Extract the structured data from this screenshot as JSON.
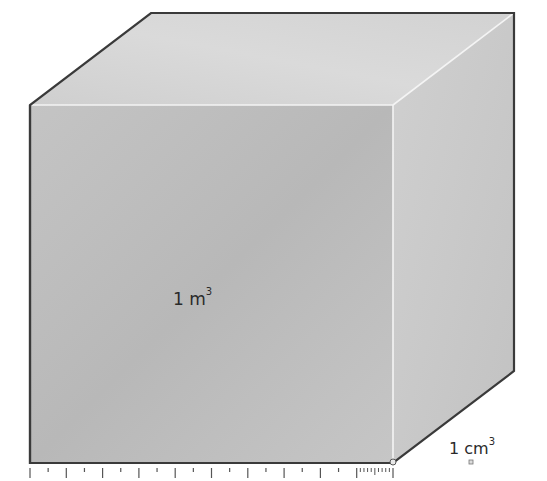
{
  "diagram": {
    "large_cube": {
      "label_prefix": "1 m",
      "label_exponent": "3",
      "front_face": {
        "x1": 30,
        "y1": 105,
        "x2": 393,
        "y2": 463
      },
      "depth_offset": {
        "dx": 121,
        "dy": -92
      },
      "colors": {
        "front": "#b9b9b9",
        "top": "#d3d3d3",
        "side": "#c9c9c9",
        "outline": "#3a3a3a",
        "highlight_edge": "#f4f4f4"
      }
    },
    "small_cube": {
      "label_prefix": "1 cm",
      "label_exponent": "3",
      "x": 469,
      "y": 460,
      "size": 4
    },
    "ruler": {
      "x_start": 30,
      "x_end": 393,
      "y": 468,
      "major_ticks": 10,
      "fine_ticks_in_last_segment": 10,
      "color": "#555555"
    }
  }
}
